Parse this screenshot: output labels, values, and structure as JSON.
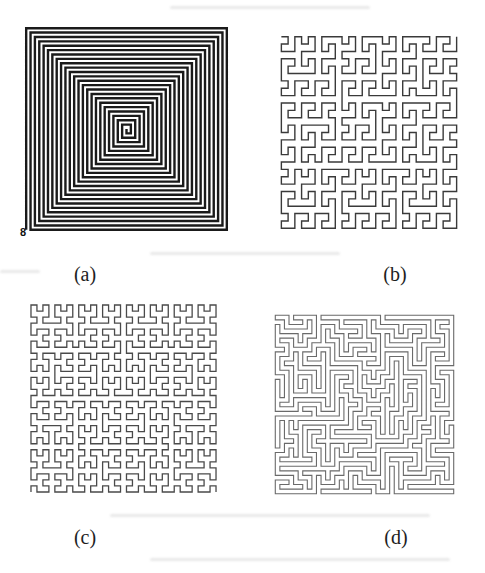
{
  "figure": {
    "type": "scanned-paper-figure",
    "panels": [
      {
        "id": "a",
        "caption": "(a)",
        "pattern": "square-spiral",
        "turns": 23,
        "stroke_color": "#1a1a1a",
        "stroke_width": 2.4,
        "start_marker": "8"
      },
      {
        "id": "b",
        "caption": "(b)",
        "pattern": "peano-curve",
        "order": 3,
        "stroke_color": "#3a3a3a",
        "stroke_width": 1.4
      },
      {
        "id": "c",
        "caption": "(c)",
        "pattern": "hilbert-curve",
        "order": 5,
        "stroke_color": "#4a4a4a",
        "stroke_width": 1.3
      },
      {
        "id": "d",
        "caption": "(d)",
        "pattern": "random-space-filling-path",
        "grid": 40,
        "seed": 7,
        "stroke_color": "#6a6a6a",
        "stroke_width": 1.1
      }
    ]
  }
}
